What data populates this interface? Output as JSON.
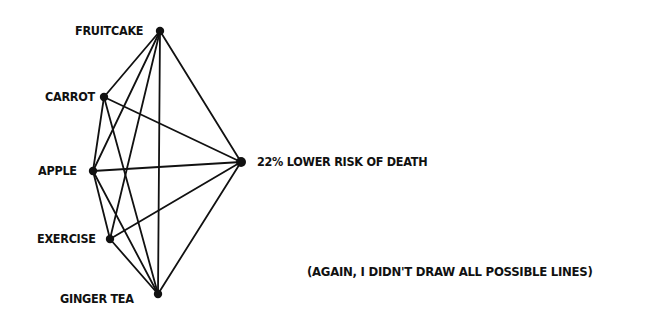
{
  "diagram": {
    "type": "graph",
    "nodes": [
      {
        "id": "fruitcake",
        "label": "FRUITCAKE",
        "x": 160,
        "y": 31
      },
      {
        "id": "carrot",
        "label": "CARROT",
        "x": 104,
        "y": 97
      },
      {
        "id": "apple",
        "label": "APPLE",
        "x": 93,
        "y": 171
      },
      {
        "id": "exercise",
        "label": "EXERCISE",
        "x": 110,
        "y": 239
      },
      {
        "id": "ginger_tea",
        "label": "GINGER TEA",
        "x": 158,
        "y": 294
      },
      {
        "id": "death",
        "label": "22% LOWER RISK OF DEATH",
        "x": 241,
        "y": 162
      }
    ],
    "edges": [
      [
        "fruitcake",
        "carrot"
      ],
      [
        "fruitcake",
        "apple"
      ],
      [
        "fruitcake",
        "exercise"
      ],
      [
        "fruitcake",
        "ginger_tea"
      ],
      [
        "fruitcake",
        "death"
      ],
      [
        "carrot",
        "apple"
      ],
      [
        "carrot",
        "ginger_tea"
      ],
      [
        "carrot",
        "death"
      ],
      [
        "apple",
        "exercise"
      ],
      [
        "apple",
        "ginger_tea"
      ],
      [
        "apple",
        "death"
      ],
      [
        "exercise",
        "ginger_tea"
      ],
      [
        "exercise",
        "death"
      ],
      [
        "ginger_tea",
        "death"
      ]
    ],
    "note": "(AGAIN, I DIDN'T DRAW ALL POSSIBLE LINES)",
    "colors": {
      "ink": "#111111",
      "background": "#ffffff"
    }
  }
}
